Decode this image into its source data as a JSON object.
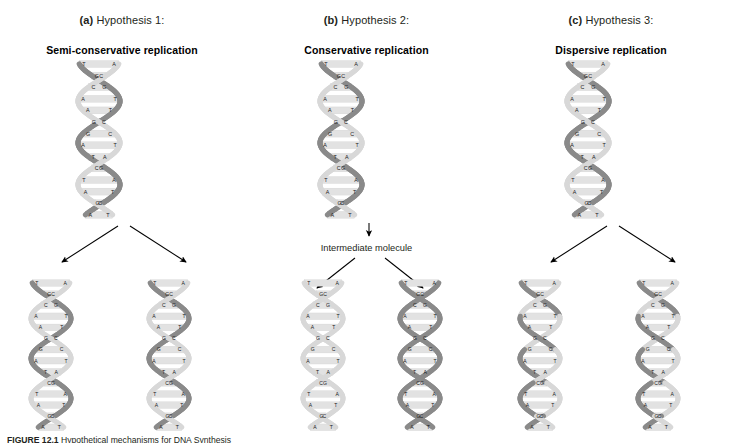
{
  "figure": {
    "caption_label": "FIGURE 12.1",
    "caption_text": "Hypothetical mechanisms for DNA Synthesis"
  },
  "panels": [
    {
      "tag": "(a)",
      "hypothesis": "Hypothesis 1:",
      "subtitle": "Semi-conservative replication",
      "has_intermediate": false,
      "intermediate_label": "",
      "daughters": [
        "hybrid-old-new",
        "hybrid-old-new"
      ]
    },
    {
      "tag": "(b)",
      "hypothesis": "Hypothesis 2:",
      "subtitle": "Conservative replication",
      "has_intermediate": true,
      "intermediate_label": "Intermediate molecule",
      "daughters": [
        "all-new",
        "all-old"
      ]
    },
    {
      "tag": "(c)",
      "hypothesis": "Hypothesis 3:",
      "subtitle": "Dispersive replication",
      "has_intermediate": false,
      "intermediate_label": "",
      "daughters": [
        "dispersed",
        "dispersed"
      ]
    }
  ],
  "dna": {
    "base_pairs": [
      {
        "left": "T",
        "right": "A"
      },
      {
        "left": "G",
        "right": "C"
      },
      {
        "left": "C",
        "right": "G"
      },
      {
        "left": "A",
        "right": "T"
      },
      {
        "left": "A",
        "right": "T"
      },
      {
        "left": "C",
        "right": "G"
      },
      {
        "left": "G",
        "right": "C"
      },
      {
        "left": "A",
        "right": "T"
      },
      {
        "left": "T",
        "right": "A"
      },
      {
        "left": "C",
        "right": "G"
      },
      {
        "left": "T",
        "right": "A"
      },
      {
        "left": "A",
        "right": "T"
      },
      {
        "left": "C",
        "right": "G"
      },
      {
        "left": "A",
        "right": "T"
      }
    ],
    "strand_colors": {
      "old_dark": "#8a8a8a",
      "new_light": "#d8d8d8",
      "rung": "#e2e2e2",
      "outline": "#9a9a9a"
    }
  }
}
